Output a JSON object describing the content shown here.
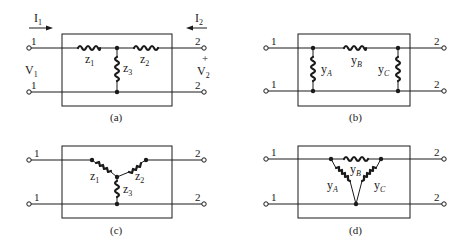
{
  "figure": {
    "panels": [
      {
        "id": "a",
        "caption": "(a)",
        "topology": "T-network (impedance)",
        "elements": [
          {
            "name": "z",
            "sub": "1"
          },
          {
            "name": "z",
            "sub": "2"
          },
          {
            "name": "z",
            "sub": "3"
          }
        ],
        "port_labels": {
          "left_top": "1",
          "left_bottom": "1",
          "right_top": "2",
          "right_bottom": "2"
        },
        "currents": [
          {
            "name": "I",
            "sub": "1"
          },
          {
            "name": "I",
            "sub": "2"
          }
        ],
        "voltages": [
          {
            "name": "V",
            "sub": "1"
          },
          {
            "name": "V",
            "sub": "2",
            "polarity": "+"
          }
        ]
      },
      {
        "id": "b",
        "caption": "(b)",
        "topology": "Pi-network (admittance)",
        "elements": [
          {
            "name": "y",
            "sub": "A"
          },
          {
            "name": "y",
            "sub": "B"
          },
          {
            "name": "y",
            "sub": "C"
          }
        ],
        "port_labels": {
          "left_top": "1",
          "left_bottom": "1",
          "right_top": "2",
          "right_bottom": "2"
        }
      },
      {
        "id": "c",
        "caption": "(c)",
        "topology": "Y (wye) network",
        "elements": [
          {
            "name": "z",
            "sub": "1"
          },
          {
            "name": "z",
            "sub": "2"
          },
          {
            "name": "z",
            "sub": "3"
          }
        ],
        "port_labels": {
          "left_top": "1",
          "left_bottom": "1",
          "right_top": "2",
          "right_bottom": "2"
        }
      },
      {
        "id": "d",
        "caption": "(d)",
        "topology": "Delta network",
        "elements": [
          {
            "name": "y",
            "sub": "A"
          },
          {
            "name": "y",
            "sub": "B"
          },
          {
            "name": "y",
            "sub": "C"
          }
        ],
        "port_labels": {
          "left_top": "1",
          "left_bottom": "1",
          "right_top": "2",
          "right_bottom": "2"
        }
      }
    ]
  }
}
